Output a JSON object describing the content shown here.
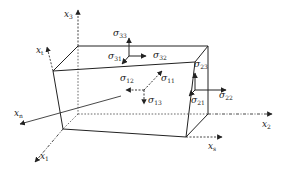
{
  "diagram": {
    "type": "stress-element-3d",
    "colors": {
      "line": "#222222",
      "background": "#ffffff"
    },
    "axes": [
      {
        "id": "x3",
        "base": "x",
        "sub": "3"
      },
      {
        "id": "x2",
        "base": "x",
        "sub": "2"
      },
      {
        "id": "x1",
        "base": "x",
        "sub": "1"
      },
      {
        "id": "xt",
        "base": "x",
        "sub": "t"
      },
      {
        "id": "xn",
        "base": "x",
        "sub": "n"
      },
      {
        "id": "xs",
        "base": "x",
        "sub": "s"
      }
    ],
    "stresses": [
      {
        "id": "s33",
        "base": "σ",
        "sub": "33"
      },
      {
        "id": "s31",
        "base": "σ",
        "sub": "31"
      },
      {
        "id": "s32",
        "base": "σ",
        "sub": "32"
      },
      {
        "id": "s12",
        "base": "σ",
        "sub": "12"
      },
      {
        "id": "s11",
        "base": "σ",
        "sub": "11"
      },
      {
        "id": "s13",
        "base": "σ",
        "sub": "13"
      },
      {
        "id": "s23",
        "base": "σ",
        "sub": "23"
      },
      {
        "id": "s21",
        "base": "σ",
        "sub": "21"
      },
      {
        "id": "s22",
        "base": "σ",
        "sub": "22"
      }
    ]
  }
}
